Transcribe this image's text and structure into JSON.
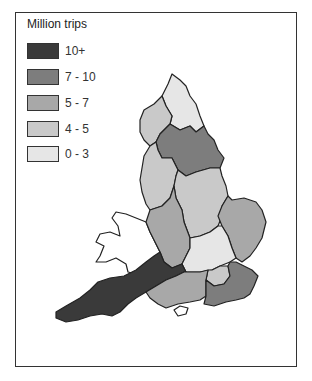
{
  "legend": {
    "title": "Million trips",
    "items": [
      {
        "label": "10+",
        "color": "#3a3a3a"
      },
      {
        "label": "7 - 10",
        "color": "#7d7d7d"
      },
      {
        "label": "5 - 7",
        "color": "#a8a8a8"
      },
      {
        "label": "4 - 5",
        "color": "#c9c9c9"
      },
      {
        "label": "0 - 3",
        "color": "#e6e6e6"
      }
    ]
  },
  "map": {
    "regions": [
      {
        "name": "cumbria",
        "class": "4 - 5"
      },
      {
        "name": "northumbria",
        "class": "0 - 3"
      },
      {
        "name": "north-west",
        "class": "4 - 5"
      },
      {
        "name": "yorkshire",
        "class": "7 - 10"
      },
      {
        "name": "heart-of-england",
        "class": "5 - 7"
      },
      {
        "name": "east-midlands",
        "class": "4 - 5"
      },
      {
        "name": "east-anglia",
        "class": "5 - 7"
      },
      {
        "name": "thames-chilterns",
        "class": "0 - 3"
      },
      {
        "name": "london",
        "class": "4 - 5"
      },
      {
        "name": "west-country",
        "class": "10+"
      },
      {
        "name": "southern",
        "class": "5 - 7"
      },
      {
        "name": "south-east",
        "class": "7 - 10"
      }
    ]
  }
}
